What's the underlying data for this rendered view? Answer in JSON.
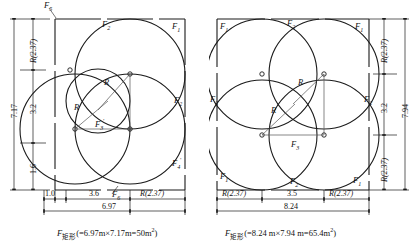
{
  "figure": {
    "panels": [
      {
        "id": "left",
        "caption_symbol": "F",
        "caption_sub": "矩形",
        "caption_expr": "(=6.97m×7.17m=50m",
        "caption_sup": "2",
        "caption_close": ")",
        "rect_width": "6.97",
        "rect_height": "7.17",
        "area": "50",
        "area_unit": "m2",
        "horizontal_dims": [
          {
            "label": "1.0",
            "italic": false
          },
          {
            "label": "3.6",
            "italic": false
          },
          {
            "label": "R(2.37)",
            "italic": true
          }
        ],
        "horizontal_total": "6.97",
        "vertical_dims": [
          {
            "label": "R(2.37)",
            "italic": true
          },
          {
            "label": "3.2",
            "italic": false
          },
          {
            "label": "1.6",
            "italic": false
          }
        ],
        "vertical_total": "7.17",
        "region_labels": [
          {
            "name": "F5",
            "sym": "F",
            "sub": "5",
            "prime": ""
          },
          {
            "name": "F2-top",
            "sym": "F",
            "sub": "2",
            "prime": ""
          },
          {
            "name": "F1",
            "sym": "F",
            "sub": "1",
            "prime": ""
          },
          {
            "name": "F2-right",
            "sym": "F",
            "sub": "2",
            "prime": ""
          },
          {
            "name": "F4-prime",
            "sym": "F",
            "sub": "4",
            "prime": "'"
          },
          {
            "name": "F3-prime",
            "sym": "F",
            "sub": "3",
            "prime": "'"
          },
          {
            "name": "F6",
            "sym": "F",
            "sub": "6",
            "prime": ""
          }
        ],
        "radius_labels": [
          "R",
          "R"
        ]
      },
      {
        "id": "right",
        "caption_symbol": "F",
        "caption_sub": "矩形",
        "caption_expr": "(=8.24 m×7.94 m=65.4m",
        "caption_sup": "2",
        "caption_close": ")",
        "rect_width": "8.24",
        "rect_height": "7.94",
        "area": "65.4",
        "area_unit": "m2",
        "horizontal_dims": [
          {
            "label": "R(2.37)",
            "italic": true
          },
          {
            "label": "3.5",
            "italic": false
          },
          {
            "label": "R(2.37)",
            "italic": true
          }
        ],
        "horizontal_total": "8.24",
        "vertical_dims": [
          {
            "label": "R(2.37)",
            "italic": true
          },
          {
            "label": "3.2",
            "italic": false
          },
          {
            "label": "R(2.37)",
            "italic": true
          }
        ],
        "vertical_total": "7.94",
        "region_labels": [
          {
            "name": "F1-topleft",
            "sym": "F",
            "sub": "1",
            "prime": ""
          },
          {
            "name": "F2-top",
            "sym": "F",
            "sub": "2",
            "prime": ""
          },
          {
            "name": "F1-topright",
            "sym": "F",
            "sub": "1",
            "prime": ""
          },
          {
            "name": "F2-left",
            "sym": "F",
            "sub": "2",
            "prime": ""
          },
          {
            "name": "F2-right",
            "sym": "F",
            "sub": "2",
            "prime": ""
          },
          {
            "name": "F3",
            "sym": "F",
            "sub": "3",
            "prime": ""
          },
          {
            "name": "F1-bottomleft",
            "sym": "F",
            "sub": "1",
            "prime": ""
          },
          {
            "name": "F2-bottom",
            "sym": "F",
            "sub": "2",
            "prime": ""
          },
          {
            "name": "F1-bottomright",
            "sym": "F",
            "sub": "1",
            "prime": ""
          }
        ],
        "radius_labels": [
          "R",
          "R"
        ]
      }
    ],
    "colors": {
      "line": "#1a1a1a",
      "thin": "#555555",
      "background": "#ffffff"
    }
  }
}
